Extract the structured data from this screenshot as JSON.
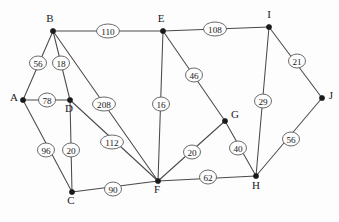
{
  "diagram": {
    "type": "node-link-graph",
    "width": 339,
    "height": 222,
    "background_color": "#fdfdfd",
    "edge_color": "#4a4a4a",
    "node_color": "#1a1a1a",
    "label_bubble_fill": "#fdfdfd",
    "label_bubble_stroke": "#5a5a5a"
  },
  "nodes": [
    {
      "id": "A",
      "label": "A",
      "x": 23,
      "y": 100,
      "label_dx": -9,
      "label_dy": 1
    },
    {
      "id": "B",
      "label": "B",
      "x": 53,
      "y": 31,
      "label_dx": -3,
      "label_dy": -9
    },
    {
      "id": "C",
      "label": "C",
      "x": 72,
      "y": 192,
      "label_dx": -1,
      "label_dy": 12
    },
    {
      "id": "D",
      "label": "D",
      "x": 70,
      "y": 100,
      "label_dx": -1,
      "label_dy": 12
    },
    {
      "id": "E",
      "label": "E",
      "x": 163,
      "y": 31,
      "label_dx": -2,
      "label_dy": -9
    },
    {
      "id": "F",
      "label": "F",
      "x": 158,
      "y": 181,
      "label_dx": -1,
      "label_dy": 12
    },
    {
      "id": "G",
      "label": "G",
      "x": 225,
      "y": 121,
      "label_dx": 10,
      "label_dy": -3
    },
    {
      "id": "H",
      "label": "H",
      "x": 256,
      "y": 176,
      "label_dx": 0,
      "label_dy": 13
    },
    {
      "id": "I",
      "label": "I",
      "x": 269,
      "y": 27,
      "label_dx": 0,
      "label_dy": -9
    },
    {
      "id": "J",
      "label": "J",
      "x": 322,
      "y": 98,
      "label_dx": 9,
      "label_dy": 1
    }
  ],
  "edges": [
    {
      "from": "A",
      "to": "B",
      "weight": "56",
      "lx": 38,
      "ly": 63
    },
    {
      "from": "A",
      "to": "D",
      "weight": "78",
      "lx": 47,
      "ly": 100
    },
    {
      "from": "A",
      "to": "C",
      "weight": "96",
      "lx": 46,
      "ly": 150
    },
    {
      "from": "B",
      "to": "D",
      "weight": "18",
      "lx": 61,
      "ly": 63
    },
    {
      "from": "B",
      "to": "E",
      "weight": "110",
      "lx": 108,
      "ly": 31
    },
    {
      "from": "B",
      "to": "F",
      "weight": "208",
      "lx": 104,
      "ly": 104
    },
    {
      "from": "D",
      "to": "F",
      "weight": "112",
      "lx": 112,
      "ly": 142
    },
    {
      "from": "D",
      "to": "C",
      "weight": "20",
      "lx": 71,
      "ly": 150
    },
    {
      "from": "C",
      "to": "F",
      "weight": "90",
      "lx": 113,
      "ly": 189
    },
    {
      "from": "E",
      "to": "I",
      "weight": "108",
      "lx": 215,
      "ly": 29
    },
    {
      "from": "E",
      "to": "F",
      "weight": "16",
      "lx": 161,
      "ly": 104
    },
    {
      "from": "E",
      "to": "G",
      "weight": "46",
      "lx": 194,
      "ly": 75
    },
    {
      "from": "G",
      "to": "F",
      "weight": "20",
      "lx": 192,
      "ly": 152
    },
    {
      "from": "G",
      "to": "H",
      "weight": "40",
      "lx": 238,
      "ly": 148
    },
    {
      "from": "I",
      "to": "H",
      "weight": "29",
      "lx": 263,
      "ly": 101
    },
    {
      "from": "I",
      "to": "J",
      "weight": "21",
      "lx": 297,
      "ly": 61
    },
    {
      "from": "J",
      "to": "H",
      "weight": "56",
      "lx": 291,
      "ly": 139
    },
    {
      "from": "F",
      "to": "H",
      "weight": "62",
      "lx": 208,
      "ly": 177
    }
  ]
}
